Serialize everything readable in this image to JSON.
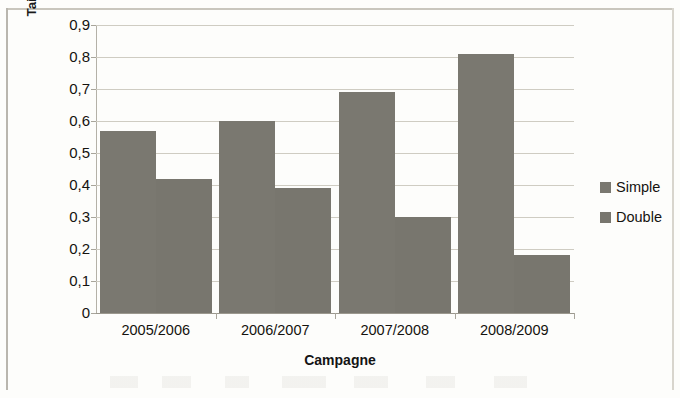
{
  "chart_data": {
    "type": "bar",
    "title": "",
    "subtitle": "",
    "xlabel": "Campagne",
    "ylabel": "Taille de la portée à la naissance",
    "categories": [
      "2005/2006",
      "2006/2007",
      "2007/2008",
      "2008/2009"
    ],
    "series": [
      {
        "name": "Simple",
        "color": "#7a7870",
        "values": [
          0.57,
          0.6,
          0.69,
          0.81
        ]
      },
      {
        "name": "Double",
        "color": "#78766e",
        "values": [
          0.42,
          0.39,
          0.3,
          0.18
        ]
      }
    ],
    "ylim": [
      0,
      0.9
    ],
    "ytick_labels": [
      "0,9",
      "0,8",
      "0,7",
      "0,6",
      "0,5",
      "0,4",
      "0,3",
      "0,2",
      "0,1",
      "0"
    ],
    "ytick_values": [
      0.9,
      0.8,
      0.7,
      0.6,
      0.5,
      0.4,
      0.3,
      0.2,
      0.1,
      0
    ],
    "grid": true,
    "grid_axis": "y",
    "legend_position": "right",
    "decimal_separator": ","
  },
  "axes": {
    "y_title": "Taille de la portée à la naissance",
    "x_title": "Campagne"
  },
  "legend": {
    "items": [
      {
        "label": "Simple"
      },
      {
        "label": "Double"
      }
    ]
  },
  "colors": {
    "bar": "#7a7870",
    "grid": "#cfccc2",
    "axis": "#9b988e",
    "text": "#15130f",
    "background": "#fdfdfb"
  }
}
